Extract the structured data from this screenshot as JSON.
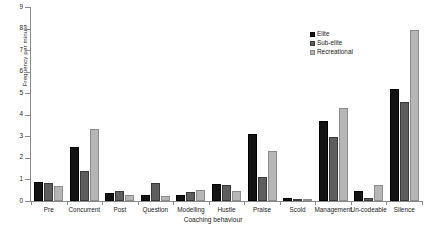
{
  "chart_data": {
    "type": "bar",
    "title": "",
    "xlabel": "Coaching behaviour",
    "ylabel": "Frequency per minute",
    "ylim": [
      0,
      9
    ],
    "ytick_labels": [
      "0",
      "1",
      "2",
      "3",
      "4",
      "5",
      "6",
      "7",
      "8",
      "9"
    ],
    "yticks": [
      0,
      1,
      2,
      3,
      4,
      5,
      6,
      7,
      8,
      9
    ],
    "grid": false,
    "legend_position": "top-right",
    "categories": [
      "Pre",
      "Concurrent",
      "Post",
      "Question",
      "Modelling",
      "Hustle",
      "Praise",
      "Scold",
      "Management",
      "Un-codeable",
      "Silence"
    ],
    "series": [
      {
        "name": "Elite",
        "color": "#131313",
        "values": [
          0.9,
          2.5,
          0.35,
          0.3,
          0.3,
          0.8,
          3.1,
          0.15,
          3.7,
          0.45,
          5.2
        ]
      },
      {
        "name": "Sub-elite",
        "color": "#5e5e5e",
        "values": [
          0.85,
          1.4,
          0.45,
          0.85,
          0.4,
          0.75,
          1.1,
          0.1,
          2.95,
          0.15,
          4.6
        ]
      },
      {
        "name": "Recreational",
        "color": "#b6b6b6",
        "values": [
          0.7,
          3.35,
          0.3,
          0.25,
          0.5,
          0.45,
          2.3,
          0.05,
          4.3,
          0.75,
          7.95
        ]
      }
    ]
  },
  "legend": {
    "items": [
      {
        "label": "Elite"
      },
      {
        "label": "Sub-elite"
      },
      {
        "label": "Recreational"
      }
    ]
  },
  "axes": {
    "y_title": "Frequency per minute",
    "x_title": "Coaching behaviour"
  }
}
